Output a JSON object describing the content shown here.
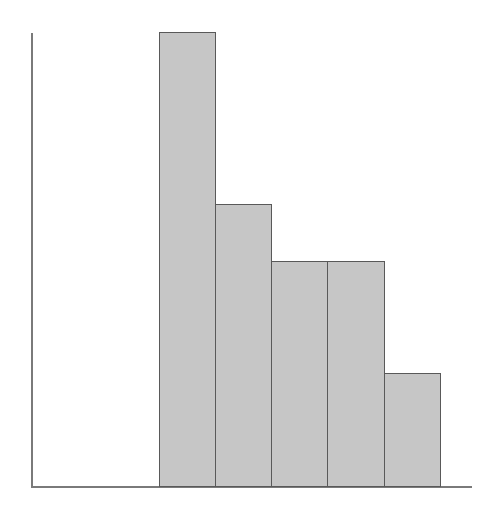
{
  "figure": {
    "width": 497,
    "height": 526,
    "background_color": "#ffffff"
  },
  "axes": {
    "y_axis_name": "y-axis-line",
    "x_axis_name": "x-axis-line",
    "line_color": "#7a7a7a",
    "tick_marks": "none",
    "tick_labels": "none"
  },
  "style": {
    "bar_fill_color": "#c6c6c6",
    "bar_edge_color": "#595959"
  },
  "chart_data": {
    "type": "bar",
    "title": "",
    "subtitle": "",
    "xlabel": "",
    "ylabel": "",
    "categories": [
      "bin-1",
      "bin-2",
      "bin-3",
      "bin-4",
      "bin-5"
    ],
    "values": [
      455,
      283,
      226,
      226,
      114
    ],
    "values_normalized": [
      1.0,
      0.62,
      0.5,
      0.5,
      0.25
    ],
    "bar_pixel_geometry": [
      {
        "label": "bin-1",
        "left": 159,
        "top": 32,
        "width": 57,
        "height": 455
      },
      {
        "label": "bin-2",
        "left": 215,
        "top": 204,
        "width": 57,
        "height": 283
      },
      {
        "label": "bin-3",
        "left": 271,
        "top": 261,
        "width": 57,
        "height": 226
      },
      {
        "label": "bin-4",
        "left": 327,
        "top": 261,
        "width": 58,
        "height": 226
      },
      {
        "label": "bin-5",
        "left": 384,
        "top": 373,
        "width": 57,
        "height": 114
      }
    ],
    "ylim": [
      0,
      455
    ],
    "xlim": [
      0,
      441
    ],
    "grid": false,
    "legend": "none",
    "legend_entries": [],
    "annotations": [],
    "tick_labels_x": [],
    "tick_labels_y": [],
    "bars_adjacent": true
  }
}
